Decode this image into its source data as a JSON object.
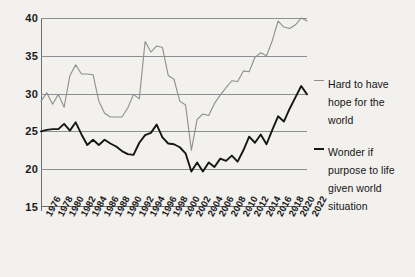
{
  "chart_data": {
    "type": "line",
    "title": "",
    "subtitle": "",
    "xlabel": "",
    "ylabel": "",
    "ylim": [
      15,
      40
    ],
    "xlim": [
      1976,
      2022
    ],
    "yticks": [
      15,
      20,
      25,
      30,
      35,
      40
    ],
    "grid": true,
    "legend_position": "right",
    "x": [
      1976,
      1977,
      1978,
      1979,
      1980,
      1981,
      1982,
      1983,
      1984,
      1985,
      1986,
      1987,
      1988,
      1989,
      1990,
      1991,
      1992,
      1993,
      1994,
      1995,
      1996,
      1997,
      1998,
      1999,
      2000,
      2001,
      2002,
      2003,
      2004,
      2005,
      2006,
      2007,
      2008,
      2009,
      2010,
      2011,
      2012,
      2013,
      2014,
      2015,
      2016,
      2017,
      2018,
      2019,
      2020,
      2021,
      2022
    ],
    "xtick_labels": [
      "1976",
      "1978",
      "1980",
      "1982",
      "1984",
      "1986",
      "1988",
      "1990",
      "1992",
      "1994",
      "1996",
      "1998",
      "2000",
      "2002",
      "2004",
      "2006",
      "2008",
      "2010",
      "2012",
      "2014",
      "2016",
      "2018",
      "2020",
      "2022"
    ],
    "series": [
      {
        "name": "Hard to have hope for the world",
        "color": "#8c8e93",
        "values": [
          29.0,
          30.1,
          28.6,
          29.9,
          28.2,
          32.4,
          33.8,
          32.6,
          32.6,
          32.5,
          29.0,
          27.4,
          26.9,
          26.9,
          26.9,
          28.1,
          29.9,
          29.3,
          36.9,
          35.5,
          36.3,
          36.1,
          32.4,
          31.9,
          29.0,
          28.5,
          22.5,
          26.6,
          27.3,
          27.1,
          28.7,
          29.8,
          30.8,
          31.7,
          31.6,
          33.0,
          32.9,
          34.8,
          35.4,
          35.0,
          37.0,
          39.6,
          38.8,
          38.6,
          39.1,
          40.0,
          39.6
        ]
      },
      {
        "name": "Wonder if purpose to life given world situation",
        "color": "#161616",
        "values": [
          25.0,
          25.2,
          25.3,
          25.3,
          26.0,
          25.1,
          26.2,
          24.6,
          23.2,
          23.9,
          23.2,
          23.9,
          23.4,
          23.0,
          22.4,
          22.0,
          21.9,
          23.5,
          24.5,
          24.8,
          25.9,
          24.2,
          23.4,
          23.3,
          22.9,
          22.1,
          19.7,
          20.9,
          19.7,
          20.9,
          20.3,
          21.4,
          21.1,
          21.8,
          21.0,
          22.5,
          24.3,
          23.5,
          24.6,
          23.3,
          25.2,
          27.0,
          26.3,
          28.0,
          29.5,
          31.0,
          29.9
        ]
      }
    ]
  },
  "legend": {
    "items": [
      {
        "label": "Hard to have hope for the world",
        "swatch": "gray-line-swatch"
      },
      {
        "label": "Wonder if purpose to life given world situation",
        "swatch": "black-line-swatch"
      }
    ]
  }
}
